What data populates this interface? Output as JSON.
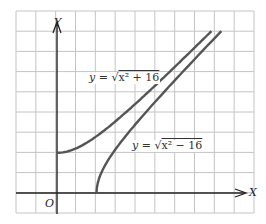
{
  "diagram": {
    "axes": {
      "x_label": "X",
      "y_label": "Y",
      "origin_label": "O"
    },
    "grid": {
      "columns": 12,
      "rows": 10,
      "unit_per_cell": 2
    },
    "curves": [
      {
        "name": "upper",
        "label_lhs": "y = ",
        "label_sqrt": "√",
        "label_radicand": "x² + 16",
        "equation": "y = √(x²+16)",
        "start": [
          0,
          4
        ]
      },
      {
        "name": "lower",
        "label_lhs": "y = ",
        "label_sqrt": "√",
        "label_radicand": "x² − 16",
        "equation": "y = √(x²−16)",
        "start": [
          4,
          0
        ]
      }
    ],
    "colors": {
      "curve": "#555555",
      "grid": "#bbbbbb",
      "axis": "#222222"
    }
  }
}
